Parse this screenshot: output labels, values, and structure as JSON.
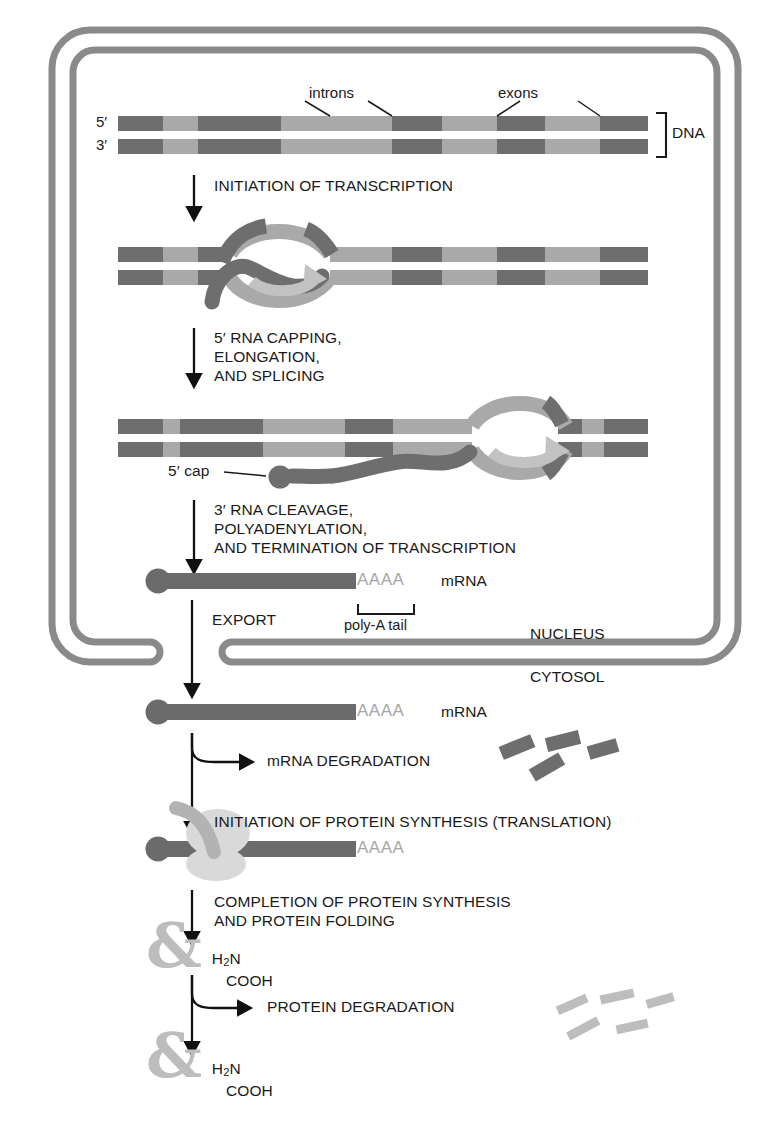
{
  "figure": {
    "type": "biology-process-diagram"
  },
  "compartments": {
    "nucleus_label": "NUCLEUS",
    "cytosol_label": "CYTOSOL"
  },
  "dna": {
    "five_prime": "5′",
    "three_prime": "3′",
    "bracket_label": "DNA",
    "introns_label": "introns",
    "exons_label": "exons",
    "dark_color": "#6e6e6e",
    "light_color": "#a9a9a9"
  },
  "steps": [
    {
      "id": "initiation-transcription",
      "lines": [
        "INITIATION OF TRANSCRIPTION"
      ]
    },
    {
      "id": "capping-elongation-splicing",
      "lines": [
        "5′ RNA CAPPING,",
        "ELONGATION,",
        "AND SPLICING"
      ]
    },
    {
      "id": "cleavage-polyadenylation",
      "lines": [
        "3′ RNA CLEAVAGE,",
        "POLYADENYLATION,",
        "AND TERMINATION OF TRANSCRIPTION"
      ]
    },
    {
      "id": "export",
      "lines": [
        "EXPORT"
      ]
    },
    {
      "id": "mrna-degradation",
      "lines": [
        "mRNA DEGRADATION"
      ]
    },
    {
      "id": "initiation-translation",
      "lines": [
        "INITIATION OF PROTEIN SYNTHESIS (TRANSLATION)"
      ]
    },
    {
      "id": "completion-folding",
      "lines": [
        "COMPLETION OF PROTEIN SYNTHESIS",
        "AND PROTEIN FOLDING"
      ]
    },
    {
      "id": "protein-degradation",
      "lines": [
        "PROTEIN DEGRADATION"
      ]
    }
  ],
  "rna": {
    "cap_label": "5′ cap",
    "poly_a_letters": "AAAA",
    "poly_a_tail_label": "poly-A tail",
    "mrna_label": "mRNA",
    "rna_color": "#6b6b6b"
  },
  "protein": {
    "glyph": "&",
    "n_terminus": "H",
    "n_terminus_sub": "2",
    "n_terminus_tail": "N",
    "c_terminus": "COOH",
    "color": "#bdbdbd"
  },
  "colors": {
    "membrane": "#8a8a8a",
    "polymerase": "#b3b3b3",
    "ribosome": "#d9d9d9",
    "text": "#1a1a1a",
    "fragment_dark": "#6e6e6e",
    "fragment_light": "#bdbdbd"
  }
}
